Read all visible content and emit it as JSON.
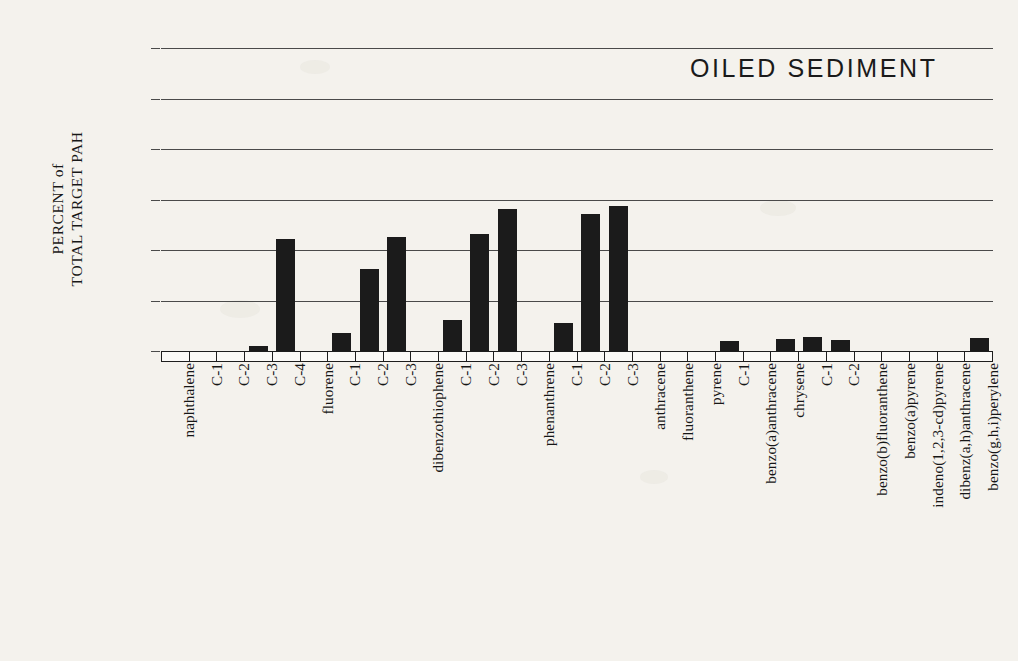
{
  "chart_data": {
    "type": "bar",
    "title": "OILED SEDIMENT",
    "xlabel": "",
    "ylabel_line1": "PERCENT of",
    "ylabel_line2": "TOTAL TARGET PAH",
    "ylim": [
      0,
      30
    ],
    "ytick_labels": [
      "30",
      "25",
      "20",
      "15",
      "10",
      "5",
      "0"
    ],
    "ytick_values": [
      30,
      25,
      20,
      15,
      10,
      5,
      0
    ],
    "grid": true,
    "legend": "none",
    "bar_color": "#1b1b1b",
    "categories": [
      "naphthalene",
      "C-1",
      "C-2",
      "C-3",
      "C-4",
      "fluorene",
      "C-1",
      "C-2",
      "C-3",
      "dibenzothiophene",
      "C-1",
      "C-2",
      "C-3",
      "phenanthrene",
      "C-1",
      "C-2",
      "C-3",
      "anthracene",
      "fluoranthene",
      "pyrene",
      "C-1",
      "benzo(a)anthracene",
      "chrysene",
      "C-1",
      "C-2",
      "benzo(b)fluoranthene",
      "benzo(a)pyrene",
      "indeno(1,2,3-cd)pyrene",
      "dibenz(a,h)anthracene",
      "benzo(g,h,i)perylene"
    ],
    "values": [
      0,
      0,
      0,
      0.5,
      11.1,
      0,
      1.8,
      8.1,
      11.3,
      0,
      3.1,
      11.6,
      14.1,
      0,
      2.8,
      13.6,
      14.4,
      0,
      0,
      0,
      1.0,
      0,
      1.2,
      1.4,
      1.1,
      0,
      0,
      0,
      0,
      1.3
    ]
  }
}
